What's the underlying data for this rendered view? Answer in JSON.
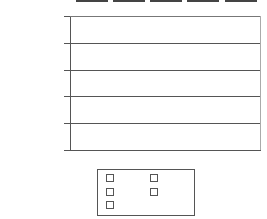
{
  "chart_data": {
    "type": "bar",
    "title": "",
    "xlabel": "",
    "ylabel": "Billion Dollars",
    "ylim": [
      0,
      150
    ],
    "yticks": [
      0,
      30,
      60,
      90,
      120,
      150
    ],
    "grid": true,
    "legend_position": "bottom",
    "categories": [
      "2003",
      "2004",
      "2005",
      "2006",
      "2007"
    ],
    "values": [
      103,
      113,
      124,
      134,
      144
    ],
    "colors": [
      "#5a5a5a",
      "#8a8a8a",
      "#a0a0a0",
      "#bcbcbc",
      "#d6d6d6"
    ]
  },
  "axis": {
    "ylabel": "Billion Dollars",
    "ticks": [
      "150",
      "120",
      "90",
      "60",
      "30",
      "0"
    ]
  },
  "legend": {
    "items": [
      {
        "label": "2003",
        "color": "#5a5a5a"
      },
      {
        "label": "2004",
        "color": "#8a8a8a"
      },
      {
        "label": "2005",
        "color": "#a0a0a0"
      },
      {
        "label": "2006",
        "color": "#bcbcbc"
      },
      {
        "label": "2007",
        "color": "#d6d6d6"
      }
    ]
  }
}
